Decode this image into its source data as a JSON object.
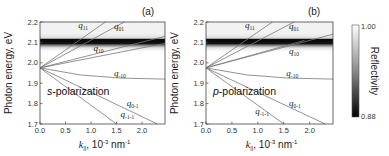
{
  "chart_data": [
    {
      "type": "heatmap",
      "panel_label": "(a)",
      "title": "",
      "annotation": "s-polarization",
      "polarization_letter": "s",
      "polarization_suffix": "-polarization",
      "xlabel": "k||, 10^-3 nm^-1",
      "ylabel": "Photon energy, eV",
      "xlim": [
        0.0,
        2.45
      ],
      "ylim": [
        1.7,
        2.2
      ],
      "xticks": [
        "0.0",
        "0.5",
        "1.0",
        "1.5",
        "2.0"
      ],
      "yticks": [
        "1.7",
        "1.8",
        "1.9",
        "2.0",
        "2.1",
        "2.2"
      ],
      "grid": false,
      "resonance_band": {
        "energy_eV": 2.11,
        "min_reflectivity": 0.88
      },
      "origin": {
        "k": 0.0,
        "E": 1.975
      },
      "modes": [
        {
          "name": "q11",
          "sub": "11",
          "points": [
            [
              0.0,
              1.975
            ],
            [
              1.28,
              2.2
            ]
          ],
          "label_pos": [
            0.75,
            2.17
          ]
        },
        {
          "name": "q01",
          "sub": "01",
          "points": [
            [
              0.0,
              1.975
            ],
            [
              1.65,
              2.2
            ]
          ],
          "label_pos": [
            1.45,
            2.165
          ]
        },
        {
          "name": "q10",
          "sub": "10",
          "points": [
            [
              0.0,
              1.975
            ],
            [
              2.45,
              2.13
            ]
          ],
          "label_pos": [
            1.05,
            2.06
          ]
        },
        {
          "name": "q10b",
          "sub": "",
          "points": [
            [
              0.0,
              1.975
            ],
            [
              2.45,
              2.095
            ]
          ],
          "label_pos": null
        },
        {
          "name": "q-10",
          "sub": "-10",
          "points": [
            [
              0.0,
              1.975
            ],
            [
              0.8,
              1.94
            ],
            [
              1.6,
              1.925
            ],
            [
              2.45,
              1.92
            ]
          ],
          "label_pos": [
            1.45,
            1.935
          ]
        },
        {
          "name": "q0-1",
          "sub": "0-1",
          "points": [
            [
              0.0,
              1.975
            ],
            [
              2.3,
              1.7
            ]
          ],
          "label_pos": [
            1.7,
            1.79
          ]
        },
        {
          "name": "q-1-1",
          "sub": "-1-1",
          "points": [
            [
              0.0,
              1.975
            ],
            [
              1.5,
              1.7
            ]
          ],
          "label_pos": [
            1.58,
            1.735
          ]
        }
      ]
    },
    {
      "type": "heatmap",
      "panel_label": "(b)",
      "title": "",
      "annotation": "p-polarization",
      "polarization_letter": "p",
      "polarization_suffix": "-polarization",
      "xlabel": "k||, 10^-3 nm^-1",
      "ylabel": "Photon energy, eV",
      "xlim": [
        0.0,
        2.45
      ],
      "ylim": [
        1.7,
        2.2
      ],
      "xticks": [
        "0.0",
        "0.5",
        "1.0",
        "1.5",
        "2.0"
      ],
      "yticks": [
        "1.7",
        "1.8",
        "1.9",
        "2.0",
        "2.1",
        "2.2"
      ],
      "grid": false,
      "resonance_band": {
        "energy_eV": 2.11,
        "min_reflectivity": 0.88
      },
      "origin": {
        "k": 0.0,
        "E": 1.975
      },
      "modes": [
        {
          "name": "q11",
          "sub": "11",
          "points": [
            [
              0.0,
              1.975
            ],
            [
              1.28,
              2.2
            ]
          ],
          "label_pos": [
            0.75,
            2.17
          ]
        },
        {
          "name": "q01",
          "sub": "01",
          "points": [
            [
              0.0,
              1.975
            ],
            [
              1.7,
              2.2
            ]
          ],
          "label_pos": [
            1.6,
            2.165
          ]
        },
        {
          "name": "q10",
          "sub": "10",
          "points": [
            [
              0.0,
              1.975
            ],
            [
              2.45,
              2.14
            ]
          ],
          "label_pos": [
            1.6,
            2.045
          ]
        },
        {
          "name": "q10b",
          "sub": "",
          "points": [
            [
              0.0,
              1.975
            ],
            [
              1.9,
              2.11
            ]
          ],
          "label_pos": null
        },
        {
          "name": "q-10",
          "sub": "-10",
          "points": [
            [
              0.0,
              1.975
            ],
            [
              0.8,
              1.94
            ],
            [
              1.6,
              1.925
            ],
            [
              2.45,
              1.92
            ]
          ],
          "label_pos": [
            1.55,
            1.935
          ]
        },
        {
          "name": "q0-1",
          "sub": "0-1",
          "points": [
            [
              0.0,
              1.975
            ],
            [
              2.3,
              1.7
            ]
          ],
          "label_pos": [
            1.6,
            1.79
          ]
        },
        {
          "name": "q-1-1",
          "sub": "-1-1",
          "points": [
            [
              0.0,
              1.975
            ],
            [
              1.5,
              1.7
            ]
          ],
          "label_pos": [
            0.95,
            1.75
          ]
        }
      ]
    }
  ],
  "colorbar": {
    "label": "Reflectivity",
    "max_label": "1.00",
    "min_label": "0.88",
    "range": [
      0.88,
      1.0
    ],
    "colors": {
      "max": "#ffffff",
      "min": "#000000"
    }
  }
}
